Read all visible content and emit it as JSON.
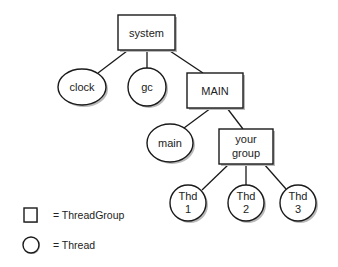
{
  "diagram": {
    "title": "",
    "nodes": {
      "system": {
        "label": "system",
        "type": "ThreadGroup"
      },
      "clock": {
        "label": "clock",
        "type": "Thread"
      },
      "gc": {
        "label": "gc",
        "type": "Thread"
      },
      "MAIN": {
        "label": "MAIN",
        "type": "ThreadGroup"
      },
      "main": {
        "label": "main",
        "type": "Thread"
      },
      "yourgroup": {
        "line1": "your",
        "line2": "group",
        "type": "ThreadGroup"
      },
      "thd1": {
        "line1": "Thd",
        "line2": "1",
        "type": "Thread"
      },
      "thd2": {
        "line1": "Thd",
        "line2": "2",
        "type": "Thread"
      },
      "thd3": {
        "line1": "Thd",
        "line2": "3",
        "type": "Thread"
      }
    },
    "edges": [
      [
        "system",
        "clock"
      ],
      [
        "system",
        "gc"
      ],
      [
        "system",
        "MAIN"
      ],
      [
        "MAIN",
        "main"
      ],
      [
        "MAIN",
        "yourgroup"
      ],
      [
        "yourgroup",
        "thd1"
      ],
      [
        "yourgroup",
        "thd2"
      ],
      [
        "yourgroup",
        "thd3"
      ]
    ]
  },
  "legend": {
    "square": {
      "icon": "square-icon",
      "label": "= ThreadGroup"
    },
    "circle": {
      "icon": "circle-icon",
      "label": "= Thread"
    }
  }
}
